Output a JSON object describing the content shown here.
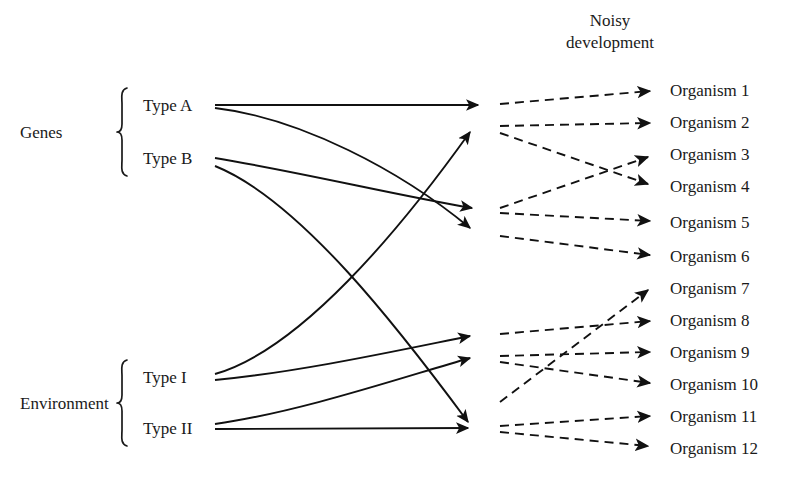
{
  "title": {
    "line1": "Noisy",
    "line2": "development"
  },
  "groups": [
    {
      "name": "Genes",
      "label": "Genes",
      "x": 20,
      "y": 132,
      "brace_x": 118,
      "brace_top": 88,
      "brace_bottom": 176,
      "members": [
        {
          "name": "type-a",
          "label": "Type A",
          "x": 143,
          "y": 105,
          "line_start_x": 215
        },
        {
          "name": "type-b",
          "label": "Type B",
          "x": 143,
          "y": 158,
          "line_start_x": 215
        }
      ]
    },
    {
      "name": "Environment",
      "label": "Environment",
      "x": 20,
      "y": 403,
      "brace_x": 118,
      "brace_top": 360,
      "brace_bottom": 446,
      "members": [
        {
          "name": "type-i",
          "label": "Type I",
          "x": 143,
          "y": 377,
          "line_start_x": 215
        },
        {
          "name": "type-ii",
          "label": "Type II",
          "x": 143,
          "y": 428,
          "line_start_x": 215
        }
      ]
    }
  ],
  "nodes": [
    {
      "id": "n1",
      "x": 490,
      "y": 105
    },
    {
      "id": "n2",
      "x": 490,
      "y": 128
    },
    {
      "id": "n3",
      "x": 490,
      "y": 210
    },
    {
      "id": "n4",
      "x": 490,
      "y": 232
    },
    {
      "id": "n5",
      "x": 490,
      "y": 335
    },
    {
      "id": "n6",
      "x": 490,
      "y": 357
    },
    {
      "id": "n7",
      "x": 490,
      "y": 405
    },
    {
      "id": "n8",
      "x": 490,
      "y": 427
    }
  ],
  "organisms": [
    {
      "name": "organism-1",
      "label": "Organism 1",
      "x": 670,
      "y": 90,
      "arrow_end_x": 658
    },
    {
      "name": "organism-2",
      "label": "Organism 2",
      "x": 670,
      "y": 122,
      "arrow_end_x": 658
    },
    {
      "name": "organism-3",
      "label": "Organism 3",
      "x": 670,
      "y": 154,
      "arrow_end_x": 658
    },
    {
      "name": "organism-4",
      "label": "Organism 4",
      "x": 670,
      "y": 186,
      "arrow_end_x": 658
    },
    {
      "name": "organism-5",
      "label": "Organism 5",
      "x": 670,
      "y": 222,
      "arrow_end_x": 658
    },
    {
      "name": "organism-6",
      "label": "Organism 6",
      "x": 670,
      "y": 256,
      "arrow_end_x": 658
    },
    {
      "name": "organism-7",
      "label": "Organism 7",
      "x": 670,
      "y": 288,
      "arrow_end_x": 658
    },
    {
      "name": "organism-8",
      "label": "Organism 8",
      "x": 670,
      "y": 320,
      "arrow_end_x": 658
    },
    {
      "name": "organism-9",
      "label": "Organism 9",
      "x": 670,
      "y": 352,
      "arrow_end_x": 658
    },
    {
      "name": "organism-10",
      "label": "Organism 10",
      "x": 670,
      "y": 384,
      "arrow_end_x": 658
    },
    {
      "name": "organism-11",
      "label": "Organism 11",
      "x": 670,
      "y": 416,
      "arrow_end_x": 658
    },
    {
      "name": "organism-12",
      "label": "Organism 12",
      "x": 670,
      "y": 448,
      "arrow_end_x": 658
    }
  ],
  "solid_edges": [
    {
      "name": "type-a-to-n1",
      "from": "type-a",
      "to": "n1",
      "path": "M215,105 L478,105"
    },
    {
      "name": "type-a-to-n4",
      "from": "type-a",
      "to": "n4",
      "path": "M215,108 C300,118 400,170 470,228"
    },
    {
      "name": "type-b-to-n3",
      "from": "type-b",
      "to": "n3",
      "path": "M215,158 C300,172 400,196 472,208"
    },
    {
      "name": "type-b-to-n8",
      "from": "type-b",
      "to": "n8",
      "path": "M215,166 C300,200 400,330 468,422"
    },
    {
      "name": "type-i-to-n2",
      "from": "type-i",
      "to": "n2",
      "path": "M215,374 C300,350 400,230 470,132"
    },
    {
      "name": "type-i-to-n5",
      "from": "type-i",
      "to": "n5",
      "path": "M215,380 C300,372 400,350 470,336"
    },
    {
      "name": "type-ii-to-n6",
      "from": "type-ii",
      "to": "n6",
      "path": "M215,424 C300,412 400,378 470,358"
    },
    {
      "name": "type-ii-to-n8",
      "from": "type-ii",
      "to": "n8",
      "path": "M215,429 L468,428"
    }
  ],
  "dashed_edges": [
    {
      "name": "n1-to-organism-1",
      "from": "n1",
      "to": "organism-1",
      "path": "M500,104 L650,91"
    },
    {
      "name": "n2-to-organism-2",
      "from": "n2",
      "to": "organism-2",
      "path": "M500,126 L650,123"
    },
    {
      "name": "n2-to-organism-4",
      "from": "n2",
      "to": "organism-4",
      "path": "M500,133 L648,184"
    },
    {
      "name": "n3-to-organism-3",
      "from": "n3",
      "to": "organism-3",
      "path": "M500,208 L648,157"
    },
    {
      "name": "n3-to-organism-5",
      "from": "n3",
      "to": "organism-5",
      "path": "M500,213 L650,221"
    },
    {
      "name": "n4-to-organism-6",
      "from": "n4",
      "to": "organism-6",
      "path": "M500,236 L650,255"
    },
    {
      "name": "n5-to-organism-8",
      "from": "n5",
      "to": "organism-8",
      "path": "M500,334 L650,321"
    },
    {
      "name": "n6-to-organism-9",
      "from": "n6",
      "to": "organism-9",
      "path": "M500,356 L650,352"
    },
    {
      "name": "n6-to-organism-10",
      "from": "n6",
      "to": "organism-10",
      "path": "M500,362 L650,383"
    },
    {
      "name": "n7-to-organism-7",
      "from": "n7",
      "to": "organism-7",
      "path": "M500,402 L648,290"
    },
    {
      "name": "n8-to-organism-11",
      "from": "n8",
      "to": "organism-11",
      "path": "M500,426 L650,416"
    },
    {
      "name": "n8-to-organism-12",
      "from": "n8",
      "to": "organism-12",
      "path": "M500,432 L648,446"
    }
  ],
  "colors": {
    "ink": "#1a1a1a",
    "line": "#111111",
    "background": "#ffffff"
  }
}
